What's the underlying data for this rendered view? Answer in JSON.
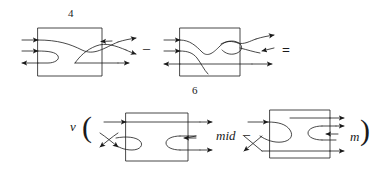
{
  "figure": {
    "type": "tangle-diagram-equation",
    "background_color": "#ffffff",
    "stroke_color": "#1a1a1a",
    "rows": [
      {
        "name": "top-row",
        "label_above": "4",
        "diagrams": [
          {
            "name": "tangle-1",
            "box": {
              "x": 38,
              "y": 28,
              "w": 64,
              "h": 48
            }
          },
          {
            "name": "tangle-2",
            "box": {
              "x": 180,
              "y": 28,
              "w": 60,
              "h": 48
            }
          }
        ],
        "operators": [
          {
            "name": "minus",
            "symbol": "–"
          },
          {
            "name": "equals",
            "symbol": "="
          }
        ]
      },
      {
        "name": "bottom-row",
        "label_above": "6",
        "prefix_symbol": "v",
        "open_paren": "(",
        "close_paren": ")",
        "diagrams": [
          {
            "name": "tangle-3",
            "box": {
              "x": 126,
              "y": 113,
              "w": 62,
              "h": 48
            }
          },
          {
            "name": "tangle-4",
            "box": {
              "x": 270,
              "y": 110,
              "w": 60,
              "h": 48
            }
          }
        ],
        "operators": [
          {
            "name": "minus",
            "symbol": "–"
          }
        ],
        "annotations": [
          {
            "name": "mid-label",
            "text": "mid"
          },
          {
            "name": "m-label",
            "text": "m"
          }
        ]
      }
    ]
  },
  "labels": {
    "four": "4",
    "six": "6",
    "v": "v",
    "open_paren": "(",
    "close_paren": ")",
    "mid": "mid",
    "m": "m",
    "minus_top": "–",
    "minus_bottom": "–",
    "equals": "="
  }
}
